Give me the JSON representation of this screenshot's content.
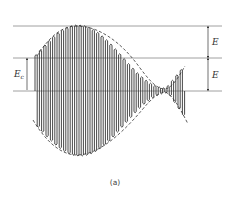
{
  "figure": {
    "caption": "(a)",
    "labels": {
      "left_amplitude": "E",
      "left_amplitude_sub": "c",
      "right_upper": "E",
      "right_lower": "E"
    },
    "colors": {
      "line": "#333333",
      "reference_line": "#888888",
      "background": "#ffffff"
    }
  }
}
